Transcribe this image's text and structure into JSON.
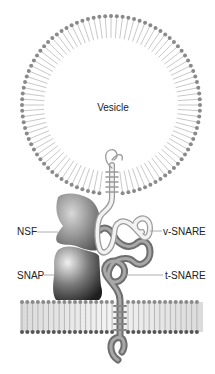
{
  "diagram": {
    "labels": {
      "vesicle": "Vesicle",
      "nsf": "NSF",
      "snap": "SNAP",
      "v_snare": "v-SNARE",
      "t_snare": "t-SNARE"
    },
    "components": [
      {
        "id": "vesicle",
        "type": "lipid-bilayer-circle"
      },
      {
        "id": "plasma-membrane",
        "type": "lipid-bilayer-flat"
      },
      {
        "id": "nsf",
        "type": "protein"
      },
      {
        "id": "snap",
        "type": "protein"
      },
      {
        "id": "v-snare",
        "type": "protein-coil",
        "anchored_in": "vesicle"
      },
      {
        "id": "t-snare",
        "type": "protein-coil",
        "anchored_in": "plasma-membrane"
      }
    ],
    "colors": {
      "background": "#ffffff",
      "lipid_head": "#8a8a8a",
      "lipid_tail": "#c8c8c8",
      "nsf": "#7a7a7a",
      "snap": "#3a3a3a",
      "v_snare": "#e6e6e6",
      "t_snare": "#8c8c8c",
      "label_text": "#222222",
      "leader_line": "#9a9a9a"
    }
  }
}
